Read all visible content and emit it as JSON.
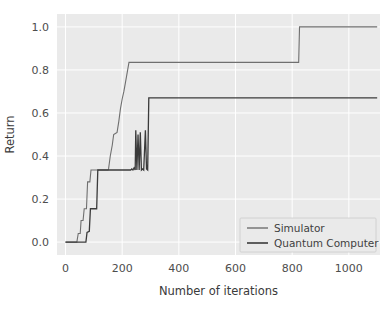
{
  "chart_data": {
    "type": "line",
    "title": "",
    "xlabel": "Number of iterations",
    "ylabel": "Return",
    "xlim": [
      -30,
      1110
    ],
    "ylim": [
      -0.06,
      1.06
    ],
    "xticks": [
      0,
      200,
      400,
      600,
      800,
      1000
    ],
    "xticklabels": [
      "0",
      "200",
      "400",
      "600",
      "800",
      "1000"
    ],
    "yticks": [
      0.0,
      0.2,
      0.4,
      0.6,
      0.8,
      1.0
    ],
    "yticklabels": [
      "0.0",
      "0.2",
      "0.4",
      "0.6",
      "0.8",
      "1.0"
    ],
    "grid": true,
    "legend_position": "lower right",
    "background_color": "#eaeaea",
    "grid_color": "#ffffff",
    "series": [
      {
        "name": "Simulator",
        "color": "#6f6f6f",
        "linewidth": 1.1,
        "points": [
          [
            0,
            0.0
          ],
          [
            40,
            0.0
          ],
          [
            45,
            0.04
          ],
          [
            52,
            0.04
          ],
          [
            55,
            0.1
          ],
          [
            62,
            0.1
          ],
          [
            66,
            0.155
          ],
          [
            74,
            0.155
          ],
          [
            78,
            0.28
          ],
          [
            86,
            0.28
          ],
          [
            90,
            0.335
          ],
          [
            150,
            0.335
          ],
          [
            152,
            0.34
          ],
          [
            158,
            0.4
          ],
          [
            165,
            0.45
          ],
          [
            170,
            0.5
          ],
          [
            176,
            0.505
          ],
          [
            182,
            0.51
          ],
          [
            188,
            0.56
          ],
          [
            194,
            0.62
          ],
          [
            200,
            0.665
          ],
          [
            206,
            0.7
          ],
          [
            212,
            0.745
          ],
          [
            218,
            0.79
          ],
          [
            224,
            0.835
          ],
          [
            823,
            0.835
          ],
          [
            826,
            1.0
          ],
          [
            1100,
            1.0
          ]
        ]
      },
      {
        "name": "Quantum Computer",
        "color": "#3b3b3b",
        "linewidth": 1.3,
        "points": [
          [
            0,
            0.0
          ],
          [
            72,
            0.0
          ],
          [
            76,
            0.045
          ],
          [
            84,
            0.05
          ],
          [
            88,
            0.155
          ],
          [
            110,
            0.155
          ],
          [
            114,
            0.335
          ],
          [
            230,
            0.335
          ],
          [
            234,
            0.34
          ],
          [
            238,
            0.335
          ],
          [
            242,
            0.345
          ],
          [
            246,
            0.335
          ],
          [
            248,
            0.52
          ],
          [
            252,
            0.335
          ],
          [
            256,
            0.5
          ],
          [
            260,
            0.335
          ],
          [
            264,
            0.51
          ],
          [
            268,
            0.335
          ],
          [
            272,
            0.34
          ],
          [
            276,
            0.335
          ],
          [
            282,
            0.52
          ],
          [
            286,
            0.34
          ],
          [
            290,
            0.335
          ],
          [
            294,
            0.67
          ],
          [
            1100,
            0.67
          ]
        ]
      }
    ]
  },
  "legend": {
    "items": [
      {
        "label": "Simulator"
      },
      {
        "label": "Quantum Computer"
      }
    ]
  }
}
